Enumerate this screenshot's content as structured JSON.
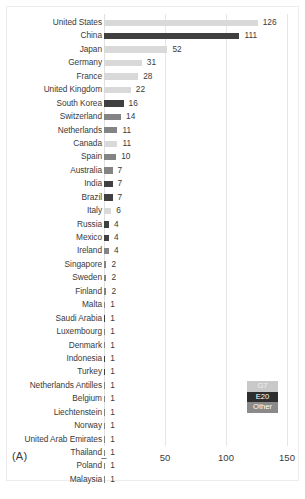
{
  "figure": {
    "panel_label": "(A)"
  },
  "legend": {
    "position": "inside-right",
    "items": [
      {
        "label": "G7",
        "key": "g7",
        "color": "#d9d9d9"
      },
      {
        "label": "E20",
        "key": "e20",
        "color": "#404040"
      },
      {
        "label": "Other",
        "key": "other",
        "color": "#848484"
      }
    ]
  },
  "chart_data": {
    "type": "bar",
    "orientation": "horizontal",
    "title": "",
    "subtitle": "",
    "xlabel": "",
    "ylabel": "",
    "xlim": [
      0,
      150
    ],
    "ylim": null,
    "grid": true,
    "xticks": [
      {
        "value": 0,
        "label": "–"
      },
      {
        "value": 50,
        "label": "50"
      },
      {
        "value": 100,
        "label": "100"
      },
      {
        "value": 150,
        "label": "150"
      }
    ],
    "legend_entries": [
      "G7",
      "E20",
      "Other"
    ],
    "categories": [
      "United States",
      "China",
      "Japan",
      "Germany",
      "France",
      "United Kingdom",
      "South Korea",
      "Switzerland",
      "Netherlands",
      "Canada",
      "Spain",
      "Australia",
      "India",
      "Brazil",
      "Italy",
      "Russia",
      "Mexico",
      "Ireland",
      "Singapore",
      "Sweden",
      "Finland",
      "Malta",
      "Saudi Arabia",
      "Luxembourg",
      "Denmark",
      "Indonesia",
      "Turkey",
      "Netherlands Antilles",
      "Belgium",
      "Liechtenstein",
      "Norway",
      "United Arab Emirates",
      "Thailand",
      "Poland",
      "Malaysia"
    ],
    "values": [
      126,
      111,
      52,
      31,
      28,
      22,
      16,
      14,
      11,
      11,
      10,
      7,
      7,
      7,
      6,
      4,
      4,
      4,
      2,
      2,
      2,
      1,
      1,
      1,
      1,
      1,
      1,
      1,
      1,
      1,
      1,
      1,
      1,
      1,
      1
    ],
    "groups": [
      "g7",
      "e20",
      "g7",
      "g7",
      "g7",
      "g7",
      "e20",
      "other",
      "other",
      "g7",
      "other",
      "other",
      "e20",
      "e20",
      "g7",
      "e20",
      "e20",
      "other",
      "other",
      "other",
      "other",
      "other",
      "e20",
      "other",
      "other",
      "e20",
      "e20",
      "other",
      "other",
      "other",
      "other",
      "other",
      "other",
      "other",
      "other"
    ],
    "data_labels": [
      "126",
      "111",
      "52",
      "31",
      "28",
      "22",
      "16",
      "14",
      "11",
      "11",
      "10",
      "7",
      "7",
      "7",
      "6",
      "4",
      "4",
      "4",
      "2",
      "2",
      "2",
      "1",
      "1",
      "1",
      "1",
      "1",
      "1",
      "1",
      "1",
      "1",
      "1",
      "1",
      "1",
      "1",
      "1"
    ]
  }
}
